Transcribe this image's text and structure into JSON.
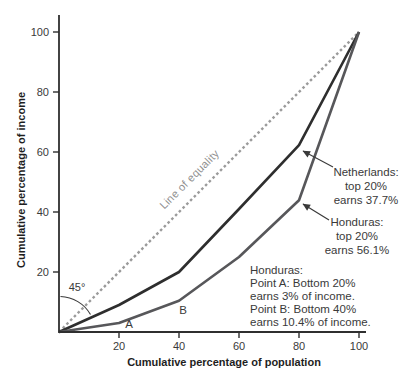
{
  "chart_data": {
    "type": "line",
    "xlabel": "Cumulative percentage of population",
    "ylabel": "Cumulative percentage of income",
    "xlim": [
      0,
      100
    ],
    "ylim": [
      0,
      100
    ],
    "x_ticks": [
      20,
      40,
      60,
      80,
      100
    ],
    "y_ticks": [
      20,
      40,
      60,
      80,
      100
    ],
    "grid": false,
    "legend_position": "inline-callouts",
    "series": [
      {
        "name": "Line of equality",
        "style": "dashed",
        "color": "#9b9b9b",
        "width": 2.4,
        "points": [
          [
            0,
            0
          ],
          [
            100,
            100
          ]
        ]
      },
      {
        "name": "Netherlands",
        "style": "solid",
        "color": "#2e2e2e",
        "width": 2.6,
        "points": [
          [
            0,
            0
          ],
          [
            20,
            9
          ],
          [
            40,
            20
          ],
          [
            60,
            41
          ],
          [
            80,
            62.3
          ],
          [
            100,
            100
          ]
        ]
      },
      {
        "name": "Honduras",
        "style": "solid",
        "color": "#57575a",
        "width": 2.6,
        "points": [
          [
            0,
            0
          ],
          [
            20,
            3
          ],
          [
            40,
            10.4
          ],
          [
            60,
            25
          ],
          [
            80,
            43.9
          ],
          [
            100,
            100
          ]
        ]
      }
    ],
    "point_markers": [
      {
        "label": "A",
        "x": 20,
        "y": 3
      },
      {
        "label": "B",
        "x": 40,
        "y": 10.4
      }
    ]
  },
  "axes": {
    "x_label": "Cumulative percentage of population",
    "y_label": "Cumulative percentage of income"
  },
  "annotations": {
    "line_of_equality": "Line of equality",
    "angle": "45°",
    "point_a": "A",
    "point_b": "B",
    "netherlands_callout": {
      "line1": "Netherlands:",
      "line2": "top 20%",
      "line3": "earns 37.7%"
    },
    "honduras_callout": {
      "line1": "Honduras:",
      "line2": "top 20%",
      "line3": "earns 56.1%"
    },
    "honduras_note": {
      "line1": "Honduras:",
      "line2": "Point A: Bottom 20%",
      "line3": "earns 3% of income.",
      "line4": "Point B: Bottom 40%",
      "line5": "earns 10.4% of income."
    }
  },
  "colors": {
    "axis": "#2f2f2f",
    "tick_text": "#3a3a3a",
    "equality_line": "#9b9b9b",
    "netherlands_line": "#2e2e2e",
    "honduras_line": "#57575a",
    "annotation_gray": "#8f8f8f",
    "background": "#ffffff"
  }
}
